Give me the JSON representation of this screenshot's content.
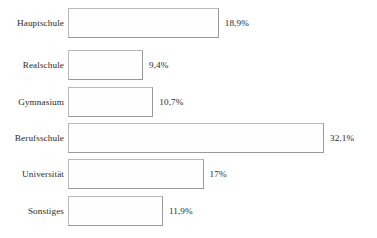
{
  "chart_data": {
    "type": "bar",
    "orientation": "horizontal",
    "title": "",
    "subtitle": "",
    "xlabel": "",
    "ylabel": "",
    "grid": false,
    "legend": null,
    "axis_visible": false,
    "xlim": [
      0,
      32.1
    ],
    "value_suffix": "%",
    "decimal_separator": ",",
    "categories": [
      "Hauptschule",
      "Realschule",
      "Gymnasium",
      "Berufsschule",
      "Universität",
      "Sonstiges"
    ],
    "values": [
      18.9,
      9.4,
      10.7,
      32.1,
      17,
      11.9
    ],
    "value_labels": [
      "18,9%",
      "9,4%",
      "10,7%",
      "32,1%",
      "17%",
      "11,9%"
    ],
    "bars": [
      {
        "category": "Hauptschule",
        "value": 18.9,
        "label": "18,9%"
      },
      {
        "category": "Realschule",
        "value": 9.4,
        "label": "9,4%"
      },
      {
        "category": "Gymnasium",
        "value": 10.7,
        "label": "10,7%"
      },
      {
        "category": "Berufsschule",
        "value": 32.1,
        "label": "32,1%"
      },
      {
        "category": "Universität",
        "value": 17,
        "label": "17%"
      },
      {
        "category": "Sonstiges",
        "value": 11.9,
        "label": "11,9%"
      }
    ],
    "colors": {
      "background": "#ffffff",
      "bar_fill": "#fefefe",
      "bar_border": "#a6a6a6",
      "text": "#2b2b2b"
    }
  }
}
